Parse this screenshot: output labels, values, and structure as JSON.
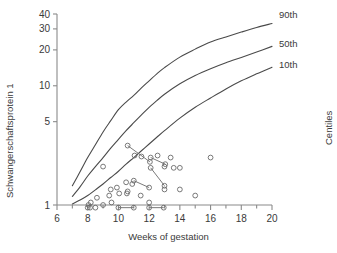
{
  "chart_data": {
    "type": "line",
    "title": "",
    "xlabel": "Weeks of gestation",
    "ylabel": "Schwangerschaftsprotein 1",
    "secondary_axis_label": "Centiles",
    "xlim": [
      6,
      20
    ],
    "ylim": [
      1,
      40
    ],
    "yscale": "log",
    "xticks": [
      6,
      8,
      10,
      12,
      14,
      16,
      18,
      20
    ],
    "xtick_labels": [
      "6",
      "8",
      "10",
      "12",
      "14",
      "16",
      "18",
      "20"
    ],
    "xminor_step": 1,
    "yticks": [
      1,
      5,
      10,
      20,
      30,
      40
    ],
    "ytick_labels": [
      "1",
      "5",
      "10",
      "20",
      "30",
      "40"
    ],
    "grid": false,
    "legend_position": "right-inline",
    "series": [
      {
        "name": "90th",
        "label": "90th",
        "type": "line",
        "color": "#4a4a4a",
        "x": [
          7.0,
          7.5,
          8.0,
          8.5,
          9.0,
          9.5,
          10.0,
          10.5,
          11.0,
          11.5,
          12.0,
          12.5,
          13.0,
          14.0,
          15.0,
          16.0,
          17.0,
          18.0,
          19.0,
          20.0
        ],
        "y": [
          1.45,
          1.9,
          2.5,
          3.2,
          4.1,
          5.1,
          6.3,
          7.3,
          8.3,
          9.6,
          11.0,
          12.6,
          14.2,
          17.4,
          20.3,
          23.3,
          25.7,
          28.2,
          30.8,
          33.3
        ]
      },
      {
        "name": "50th",
        "label": "50th",
        "type": "line",
        "color": "#4a4a4a",
        "x": [
          7.0,
          7.5,
          8.0,
          8.5,
          9.0,
          9.5,
          10.0,
          10.5,
          11.0,
          11.5,
          12.0,
          12.5,
          13.0,
          14.0,
          15.0,
          16.0,
          17.0,
          18.0,
          19.0,
          20.0
        ],
        "y": [
          1.18,
          1.42,
          1.75,
          2.1,
          2.5,
          3.0,
          3.55,
          4.2,
          4.9,
          5.7,
          6.6,
          7.5,
          8.5,
          10.4,
          12.2,
          13.9,
          15.6,
          17.3,
          19.2,
          21.4
        ]
      },
      {
        "name": "10th",
        "label": "10th",
        "type": "line",
        "color": "#4a4a4a",
        "x": [
          7.0,
          7.5,
          8.0,
          8.5,
          9.0,
          9.5,
          10.0,
          10.5,
          11.0,
          11.5,
          12.0,
          12.5,
          13.0,
          14.0,
          15.0,
          16.0,
          17.0,
          18.0,
          19.0,
          20.0
        ],
        "y": [
          1.02,
          1.1,
          1.2,
          1.34,
          1.5,
          1.7,
          1.92,
          2.2,
          2.5,
          2.85,
          3.25,
          3.7,
          4.2,
          5.35,
          6.6,
          7.9,
          9.4,
          11.0,
          12.6,
          14.3
        ]
      },
      {
        "name": "patients",
        "label": "",
        "type": "scatter",
        "marker": "open-circle",
        "color": "#6a6a6a",
        "points": [
          [
            8.0,
            0.95
          ],
          [
            8.05,
            1.0
          ],
          [
            8.15,
            0.95
          ],
          [
            8.2,
            1.05
          ],
          [
            8.5,
            0.95
          ],
          [
            8.6,
            1.15
          ],
          [
            9.0,
            1.0
          ],
          [
            9.0,
            2.1
          ],
          [
            9.4,
            1.2
          ],
          [
            9.5,
            1.35
          ],
          [
            9.55,
            1.05
          ],
          [
            9.9,
            1.4
          ],
          [
            10.0,
            0.95
          ],
          [
            10.05,
            1.25
          ],
          [
            10.5,
            1.55
          ],
          [
            10.55,
            1.25
          ],
          [
            10.6,
            1.3
          ],
          [
            10.6,
            3.15
          ],
          [
            10.9,
            1.5
          ],
          [
            11.0,
            0.95
          ],
          [
            11.0,
            1.6
          ],
          [
            11.05,
            2.6
          ],
          [
            11.45,
            1.2
          ],
          [
            11.5,
            2.55
          ],
          [
            12.0,
            1.05
          ],
          [
            12.0,
            0.95
          ],
          [
            12.0,
            1.4
          ],
          [
            12.05,
            2.3
          ],
          [
            12.1,
            2.5
          ],
          [
            12.1,
            2.05
          ],
          [
            12.55,
            2.6
          ],
          [
            12.95,
            0.95
          ],
          [
            13.0,
            1.35
          ],
          [
            13.0,
            1.45
          ],
          [
            13.0,
            2.1
          ],
          [
            13.05,
            2.2
          ],
          [
            13.4,
            2.5
          ],
          [
            13.6,
            2.05
          ],
          [
            14.0,
            2.05
          ],
          [
            14.0,
            1.35
          ],
          [
            15.0,
            1.2
          ],
          [
            16.0,
            2.5
          ]
        ],
        "connections": [
          [
            [
              10.6,
              3.15
            ],
            [
              12.05,
              2.3
            ]
          ],
          [
            [
              11.0,
              0.95
            ],
            [
              10.0,
              0.95
            ]
          ],
          [
            [
              11.0,
              1.6
            ],
            [
              12.0,
              1.4
            ]
          ],
          [
            [
              12.1,
              2.05
            ],
            [
              13.0,
              1.45
            ]
          ],
          [
            [
              12.1,
              2.5
            ],
            [
              13.05,
              2.2
            ]
          ],
          [
            [
              12.0,
              0.95
            ],
            [
              12.95,
              0.95
            ]
          ]
        ]
      }
    ]
  },
  "labels": {
    "x_title": "Weeks of gestation",
    "y_title": "Schwangerschaftsprotein 1",
    "centiles_title": "Centiles",
    "curve_90": "90th",
    "curve_50": "50th",
    "curve_10": "10th"
  },
  "colors": {
    "curve": "#4a4a4a",
    "marker": "#6a6a6a",
    "axis": "#8a8a8a",
    "text": "#3a3a3a",
    "background": "#ffffff"
  }
}
